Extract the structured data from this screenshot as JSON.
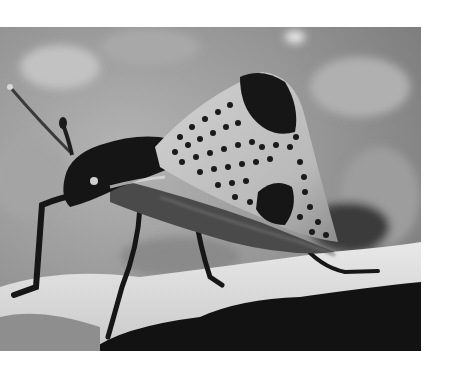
{
  "image": {
    "subject": "spotted insect on leaf edge",
    "alt": "Grayscale photograph of a bug with a tall spotted pronotum standing on the edge of a leaf",
    "colors": {
      "page_background": "#ffffff",
      "background_blur": "#9a9a9a",
      "leaf_surface": "#dcdcdc",
      "leaf_shadow": "#111111",
      "pronotum_light": "#c8c8c8",
      "spots": "#1a1a1a",
      "body_dark": "#141414"
    }
  }
}
